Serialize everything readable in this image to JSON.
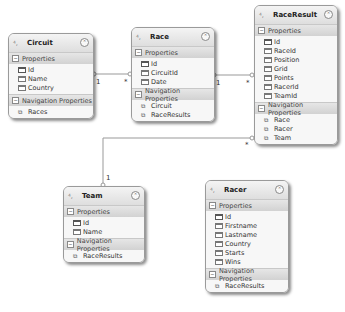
{
  "diagram": {
    "type": "entity-data-model",
    "section_labels": {
      "properties": "Properties",
      "navigation": "Navigation Properties"
    },
    "entities": {
      "circuit": {
        "name": "Circuit",
        "properties": [
          "Id",
          "Name",
          "Country"
        ],
        "navigation": [
          "Races"
        ]
      },
      "race": {
        "name": "Race",
        "properties": [
          "Id",
          "CircuitId",
          "Date"
        ],
        "navigation": [
          "Circuit",
          "RaceResults"
        ]
      },
      "raceresult": {
        "name": "RaceResult",
        "properties": [
          "Id",
          "RaceId",
          "Position",
          "Grid",
          "Points",
          "RacerId",
          "TeamId"
        ],
        "navigation": [
          "Race",
          "Racer",
          "Team"
        ]
      },
      "team": {
        "name": "Team",
        "properties": [
          "Id",
          "Name"
        ],
        "navigation": [
          "RaceResults"
        ]
      },
      "racer": {
        "name": "Racer",
        "properties": [
          "Id",
          "Firstname",
          "Lastname",
          "Country",
          "Starts",
          "Wins"
        ],
        "navigation": [
          "RaceResults"
        ]
      }
    },
    "associations": [
      {
        "from": "Circuit",
        "to": "Race",
        "from_mult": "1",
        "to_mult": "*"
      },
      {
        "from": "Race",
        "to": "RaceResult",
        "from_mult": "1",
        "to_mult": "*"
      },
      {
        "from": "Team",
        "to": "RaceResult",
        "from_mult": "1",
        "to_mult": "*"
      },
      {
        "from": "Racer",
        "to": "RaceResult",
        "from_mult": "1",
        "to_mult": "*"
      }
    ],
    "icons": {
      "entity": "entity-icon",
      "collapse": "collapse-icon",
      "key_property": "key-property-icon",
      "scalar_property": "scalar-property-icon",
      "navigation_property": "navigation-property-icon",
      "section_toggle": "minus-toggle-icon"
    },
    "colors": {
      "entity_border": "#9a9a9a",
      "entity_header": "#e6e6e6",
      "body_background": "#f7f7f7",
      "connector": "#999999"
    }
  }
}
